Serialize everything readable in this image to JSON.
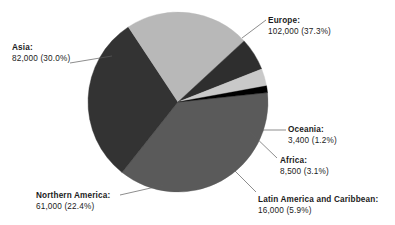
{
  "chart_data": {
    "type": "pie",
    "title": "",
    "subtitle": "",
    "xlabel": "",
    "ylabel": "",
    "legend_position": "external-labels-with-leader-lines",
    "grid": false,
    "total": 273400,
    "categories": [
      "Europe",
      "Asia",
      "Northern America",
      "Latin America and Caribbean",
      "Africa",
      "Oceania"
    ],
    "values": [
      102000,
      82000,
      61000,
      16000,
      8500,
      3400
    ],
    "percentages": [
      37.3,
      30.0,
      22.4,
      5.9,
      3.1,
      1.2
    ],
    "colors": [
      "#5a5a5a",
      "#333333",
      "#b8b8b8",
      "#2e2e2e",
      "#c9c9c9",
      "#000000"
    ],
    "start_angle_deg": -6,
    "direction": "clockwise",
    "slices": [
      {
        "name": "Europe",
        "label_name": "Europe:",
        "label_value": "102,000  (37.3%)",
        "value": 102000,
        "percent": 37.3,
        "color": "#5a5a5a",
        "label_x": 268,
        "label_y": 15,
        "leader": [
          242,
          38,
          266,
          20
        ],
        "anchor": "left"
      },
      {
        "name": "Asia",
        "label_name": "Asia:",
        "label_value": "82,000  (30.0%)",
        "value": 82000,
        "percent": 30.0,
        "color": "#333333",
        "label_x": 12,
        "label_y": 42,
        "leader": [
          70,
          63,
          112,
          56
        ],
        "anchor": "left"
      },
      {
        "name": "Northern America",
        "label_name": "Northern America:",
        "label_value": "61,000  (22.4%)",
        "value": 61000,
        "percent": 22.4,
        "color": "#b8b8b8",
        "label_x": 36,
        "label_y": 190,
        "leader": [
          120,
          195,
          164,
          185
        ],
        "anchor": "left"
      },
      {
        "name": "Latin America and Caribbean",
        "label_name": "Latin America and Caribbean:",
        "label_value": "16,000  (5.9%)",
        "value": 16000,
        "percent": 5.9,
        "color": "#2e2e2e",
        "label_x": 258,
        "label_y": 194,
        "leader": [
          232,
          168,
          256,
          192
        ],
        "anchor": "left"
      },
      {
        "name": "Africa",
        "label_name": "Africa:",
        "label_value": "8,500  (3.1%)",
        "value": 8500,
        "percent": 3.1,
        "color": "#c9c9c9",
        "label_x": 280,
        "label_y": 155,
        "leader": [
          250,
          132,
          277,
          158
        ],
        "anchor": "left"
      },
      {
        "name": "Oceania",
        "label_name": "Oceania:",
        "label_value": "3,400  (1.2%)",
        "value": 3400,
        "percent": 1.2,
        "color": "#000000",
        "label_x": 288,
        "label_y": 124,
        "leader": [
          258,
          130,
          286,
          130
        ],
        "anchor": "left"
      }
    ],
    "geometry": {
      "center_x": 178,
      "center_y": 102,
      "radius": 90
    }
  }
}
